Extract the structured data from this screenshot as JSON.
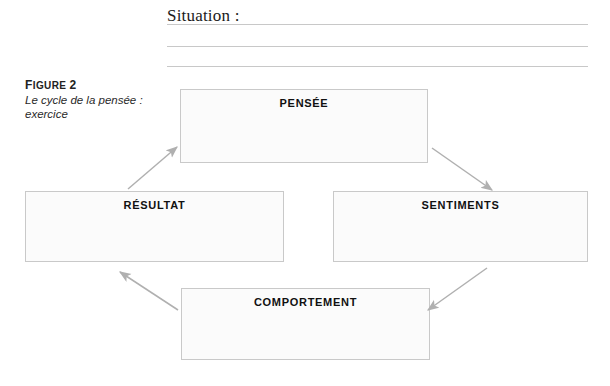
{
  "worksheet": {
    "situation_label": "Situation :",
    "blank_lines": 3
  },
  "caption": {
    "figure_prefix": "F",
    "figure_word": "IGURE",
    "figure_number": "2",
    "figure_label": "Figure 2",
    "subtitle_line_1": "Le cycle de la pensée :",
    "subtitle_line_2": "exercice"
  },
  "diagram": {
    "title": "Le cycle de la pensée : exercice",
    "type": "cycle",
    "nodes": [
      {
        "id": "pensee",
        "label": "PENSÉE"
      },
      {
        "id": "sentiments",
        "label": "SENTIMENTS"
      },
      {
        "id": "comportement",
        "label": "COMPORTEMENT"
      },
      {
        "id": "resultat",
        "label": "RÉSULTAT"
      }
    ],
    "edges": [
      {
        "from": "pensee",
        "to": "sentiments",
        "direction": "down-right"
      },
      {
        "from": "sentiments",
        "to": "comportement",
        "direction": "down-left"
      },
      {
        "from": "comportement",
        "to": "resultat",
        "direction": "up-left"
      },
      {
        "from": "resultat",
        "to": "pensee",
        "direction": "up-right"
      }
    ],
    "colors": {
      "box_fill": "#fbfbfb",
      "box_border": "#c9c9c9",
      "arrow": "#b0b0b0",
      "rule": "#c8c8c8",
      "text": "#111111"
    }
  }
}
